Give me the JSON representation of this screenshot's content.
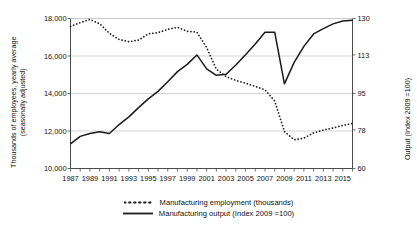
{
  "chart_data": {
    "type": "line",
    "title": "",
    "xlabel": "",
    "ylabel": "Thousands of employees, yearly average (seasonally adjusted)",
    "y2label": "Output (Index 2009 =100)",
    "grid": true,
    "legend_position": "bottom",
    "x": [
      1987,
      1988,
      1989,
      1990,
      1991,
      1992,
      1993,
      1994,
      1995,
      1996,
      1997,
      1998,
      1999,
      2000,
      2001,
      2002,
      2003,
      2004,
      2005,
      2006,
      2007,
      2008,
      2009,
      2010,
      2011,
      2012,
      2013,
      2014,
      2015,
      2016
    ],
    "xlim": [
      1987,
      2016
    ],
    "xticks": [
      1987,
      1989,
      1991,
      1993,
      1995,
      1997,
      1999,
      2001,
      2003,
      2005,
      2007,
      2009,
      2011,
      2013,
      2015
    ],
    "xtick_labels": [
      "1987",
      "1989",
      "1991",
      "1993",
      "1995",
      "1997",
      "1999",
      "2001",
      "2003",
      "2005",
      "2007",
      "2009",
      "2011",
      "2013",
      "2015"
    ],
    "ylim": [
      10000,
      18000
    ],
    "yticks": [
      10000,
      12000,
      14000,
      16000,
      18000
    ],
    "ytick_labels": [
      "10,000",
      "12,000",
      "14,000",
      "16,000",
      "18,000"
    ],
    "y2lim": [
      60,
      130
    ],
    "y2ticks": [
      60,
      78,
      95,
      113,
      130
    ],
    "y2tick_labels": [
      "60",
      "78",
      "95",
      "113",
      "130"
    ],
    "series": [
      {
        "name": "Manufacturing employment (thousands)",
        "axis": "left",
        "style": "dashed",
        "color": "#1a1a1a",
        "values": [
          17580,
          17780,
          17950,
          17720,
          17210,
          16880,
          16760,
          16850,
          17180,
          17250,
          17420,
          17530,
          17320,
          17270,
          16450,
          15300,
          14900,
          14700,
          14550,
          14380,
          14200,
          13600,
          11970,
          11530,
          11620,
          11900,
          12050,
          12160,
          12300,
          12400
        ]
      },
      {
        "name": "Manufacturing output (Index 2009 =100)",
        "axis": "right",
        "style": "solid",
        "color": "#1a1a1a",
        "values": [
          71.5,
          75.0,
          76.3,
          77.1,
          76.3,
          80.5,
          84.1,
          88.4,
          92.5,
          96.0,
          100.5,
          105.2,
          108.6,
          113.0,
          106.5,
          103.5,
          104.0,
          108.3,
          113.1,
          118.1,
          123.6,
          123.6,
          99.5,
          109.5,
          117.0,
          122.8,
          125.3,
          127.5,
          128.8,
          129.2
        ]
      }
    ]
  },
  "legend": {
    "items": [
      {
        "label": "Manufacturing employment (thousands)",
        "style": "dashed"
      },
      {
        "label": "Manufacturing output (Index 2009 =100)",
        "style": "solid"
      }
    ]
  },
  "axis_titles": {
    "left_line1": "Thousands of employees, yearly average",
    "left_line2": "(seasonally adjusted)",
    "right": "Output (Index 2009 =100)"
  }
}
